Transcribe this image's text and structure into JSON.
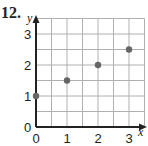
{
  "problem_number": "12.",
  "chart_data": {
    "type": "scatter",
    "title": "",
    "xlabel": "x",
    "ylabel": "y",
    "x": [
      0,
      1,
      2,
      3
    ],
    "y": [
      1,
      1.5,
      2,
      2.5
    ],
    "x_ticks": [
      "0",
      "1",
      "2",
      "3"
    ],
    "y_ticks": [
      "0",
      "1",
      "2",
      "3"
    ],
    "xlim": [
      0,
      3.5
    ],
    "ylim": [
      0,
      3.5
    ],
    "grid": true,
    "grid_step": 0.5,
    "point_color": "#666666",
    "grid_color": "#b0b0b0"
  }
}
